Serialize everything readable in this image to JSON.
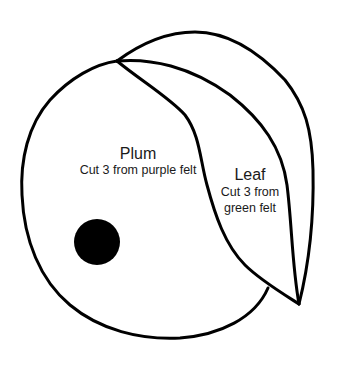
{
  "diagram": {
    "type": "sewing-pattern",
    "stroke_color": "#000000",
    "background_color": "#ffffff",
    "pieces": [
      {
        "name": "Plum",
        "instruction": "Cut 3 from purple felt",
        "shape": "rounded-circle",
        "marker": "black-dot"
      },
      {
        "name": "Leaf",
        "instruction_line1": "Cut 3 from",
        "instruction_line2": "green felt",
        "shape": "crescent-leaf"
      }
    ]
  },
  "plum": {
    "title": "Plum",
    "subtitle": "Cut 3 from purple felt"
  },
  "leaf": {
    "title": "Leaf",
    "subtitle_line1": "Cut 3 from",
    "subtitle_line2": "green felt"
  }
}
